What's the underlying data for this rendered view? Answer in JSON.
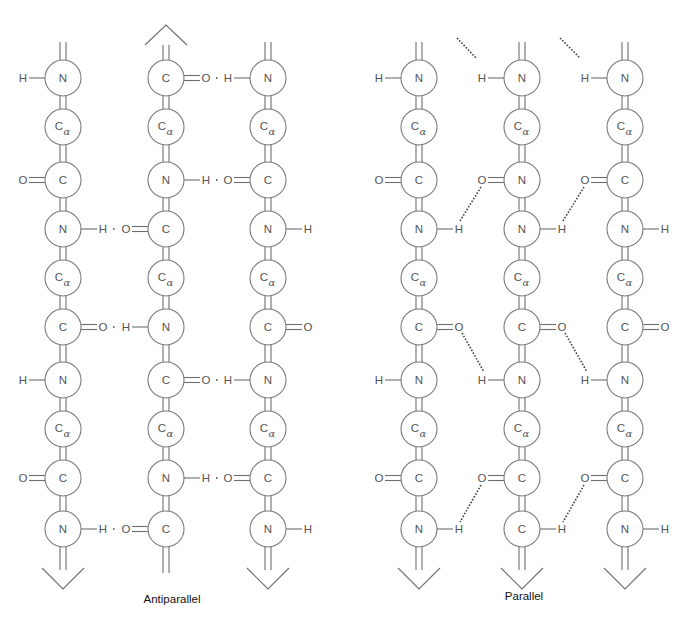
{
  "diagram": {
    "colors": {
      "stroke": "#7a7a7a",
      "text": "#555555",
      "hbond": "#444444",
      "label": "#111111",
      "background": "#ffffff"
    },
    "row_y": [
      78,
      127,
      180,
      229,
      278,
      327,
      380,
      429,
      478,
      529
    ],
    "sheets": [
      {
        "id": "antiparallel",
        "label": "Antiparallel",
        "label_pos": {
          "x": 172,
          "y": 593
        },
        "strands": [
          {
            "x": 63,
            "direction": "down",
            "atoms": [
              "N",
              "Cα",
              "C",
              "N",
              "Cα",
              "C",
              "N",
              "Cα",
              "C",
              "N"
            ],
            "substituents": [
              {
                "row": 0,
                "side": "left",
                "text": "H",
                "bond": "single"
              },
              {
                "row": 2,
                "side": "left",
                "text": "O",
                "bond": "double"
              },
              {
                "row": 3,
                "side": "right",
                "text": "H",
                "bond": "single"
              },
              {
                "row": 5,
                "side": "right",
                "text": "O",
                "bond": "double"
              },
              {
                "row": 6,
                "side": "left",
                "text": "H",
                "bond": "single"
              },
              {
                "row": 8,
                "side": "left",
                "text": "O",
                "bond": "double"
              },
              {
                "row": 9,
                "side": "right",
                "text": "H",
                "bond": "single"
              }
            ]
          },
          {
            "x": 166,
            "direction": "up",
            "atoms": [
              "C",
              "Cα",
              "N",
              "C",
              "Cα",
              "N",
              "C",
              "Cα",
              "N",
              "C"
            ],
            "substituents": [
              {
                "row": 0,
                "side": "right",
                "text": "O",
                "bond": "double"
              },
              {
                "row": 2,
                "side": "right",
                "text": "H",
                "bond": "single"
              },
              {
                "row": 3,
                "side": "left",
                "text": "O",
                "bond": "double"
              },
              {
                "row": 5,
                "side": "left",
                "text": "H",
                "bond": "single"
              },
              {
                "row": 6,
                "side": "right",
                "text": "O",
                "bond": "double"
              },
              {
                "row": 8,
                "side": "right",
                "text": "H",
                "bond": "single"
              },
              {
                "row": 9,
                "side": "left",
                "text": "O",
                "bond": "double"
              }
            ]
          },
          {
            "x": 268,
            "direction": "down",
            "atoms": [
              "N",
              "Cα",
              "C",
              "N",
              "Cα",
              "C",
              "N",
              "Cα",
              "C",
              "N"
            ],
            "substituents": [
              {
                "row": 0,
                "side": "left",
                "text": "H",
                "bond": "single"
              },
              {
                "row": 2,
                "side": "left",
                "text": "O",
                "bond": "double"
              },
              {
                "row": 3,
                "side": "right",
                "text": "H",
                "bond": "single"
              },
              {
                "row": 5,
                "side": "right",
                "text": "O",
                "bond": "double"
              },
              {
                "row": 6,
                "side": "left",
                "text": "H",
                "bond": "single"
              },
              {
                "row": 8,
                "side": "left",
                "text": "O",
                "bond": "double"
              },
              {
                "row": 9,
                "side": "right",
                "text": "H",
                "bond": "single"
              }
            ]
          }
        ],
        "hbonds": [
          {
            "row": 0,
            "from_strand": 1,
            "to_strand": 2,
            "type": "horizontal"
          },
          {
            "row": 2,
            "from_strand": 1,
            "to_strand": 2,
            "type": "horizontal"
          },
          {
            "row": 3,
            "from_strand": 0,
            "to_strand": 1,
            "type": "horizontal"
          },
          {
            "row": 5,
            "from_strand": 0,
            "to_strand": 1,
            "type": "horizontal"
          },
          {
            "row": 6,
            "from_strand": 1,
            "to_strand": 2,
            "type": "horizontal"
          },
          {
            "row": 8,
            "from_strand": 1,
            "to_strand": 2,
            "type": "horizontal"
          },
          {
            "row": 9,
            "from_strand": 0,
            "to_strand": 1,
            "type": "horizontal"
          }
        ]
      },
      {
        "id": "parallel",
        "label": "Parallel",
        "label_pos": {
          "x": 524,
          "y": 590
        },
        "strands": [
          {
            "x": 419,
            "direction": "down",
            "atoms": [
              "N",
              "Cα",
              "C",
              "N",
              "Cα",
              "C",
              "N",
              "Cα",
              "C",
              "N"
            ],
            "substituents": [
              {
                "row": 0,
                "side": "left",
                "text": "H",
                "bond": "single"
              },
              {
                "row": 2,
                "side": "left",
                "text": "O",
                "bond": "double"
              },
              {
                "row": 3,
                "side": "right",
                "text": "H",
                "bond": "single"
              },
              {
                "row": 5,
                "side": "right",
                "text": "O",
                "bond": "double"
              },
              {
                "row": 6,
                "side": "left",
                "text": "H",
                "bond": "single"
              },
              {
                "row": 8,
                "side": "left",
                "text": "O",
                "bond": "double"
              },
              {
                "row": 9,
                "side": "right",
                "text": "H",
                "bond": "single"
              }
            ]
          },
          {
            "x": 522,
            "direction": "down",
            "atoms": [
              "N",
              "Cα",
              "N",
              "N",
              "Cα",
              "C",
              "N",
              "Cα",
              "C",
              "C"
            ],
            "substituents": [
              {
                "row": 0,
                "side": "left",
                "text": "H",
                "bond": "single"
              },
              {
                "row": 2,
                "side": "left",
                "text": "O",
                "bond": "double"
              },
              {
                "row": 3,
                "side": "right",
                "text": "H",
                "bond": "single"
              },
              {
                "row": 5,
                "side": "right",
                "text": "O",
                "bond": "double"
              },
              {
                "row": 6,
                "side": "left",
                "text": "H",
                "bond": "single"
              },
              {
                "row": 8,
                "side": "left",
                "text": "O",
                "bond": "double"
              },
              {
                "row": 9,
                "side": "right",
                "text": "H",
                "bond": "single"
              }
            ]
          },
          {
            "x": 625,
            "direction": "down",
            "atoms": [
              "N",
              "Cα",
              "C",
              "N",
              "Cα",
              "C",
              "N",
              "Cα",
              "C",
              "N"
            ],
            "substituents": [
              {
                "row": 0,
                "side": "left",
                "text": "H",
                "bond": "single"
              },
              {
                "row": 2,
                "side": "left",
                "text": "O",
                "bond": "double"
              },
              {
                "row": 3,
                "side": "right",
                "text": "H",
                "bond": "single"
              },
              {
                "row": 5,
                "side": "right",
                "text": "O",
                "bond": "double"
              },
              {
                "row": 6,
                "side": "left",
                "text": "H",
                "bond": "single"
              },
              {
                "row": 8,
                "side": "left",
                "text": "O",
                "bond": "double"
              },
              {
                "row": 9,
                "side": "right",
                "text": "H",
                "bond": "single"
              }
            ]
          }
        ],
        "hbonds": [
          {
            "from": [
              457,
              38
            ],
            "to": [
              476,
              58
            ],
            "type": "diagonal",
            "partial": true
          },
          {
            "from": [
              560,
              38
            ],
            "to": [
              580,
              58
            ],
            "type": "diagonal",
            "partial": true
          },
          {
            "from": [
              481,
              187
            ],
            "to": [
              460,
              221
            ],
            "type": "diagonal"
          },
          {
            "from": [
              584,
              187
            ],
            "to": [
              563,
              221
            ],
            "type": "diagonal"
          },
          {
            "from": [
              462,
              333
            ],
            "to": [
              484,
              372
            ],
            "type": "diagonal"
          },
          {
            "from": [
              565,
              333
            ],
            "to": [
              587,
              372
            ],
            "type": "diagonal"
          },
          {
            "from": [
              481,
              485
            ],
            "to": [
              460,
              522
            ],
            "type": "diagonal"
          },
          {
            "from": [
              584,
              485
            ],
            "to": [
              563,
              522
            ],
            "type": "diagonal"
          }
        ]
      }
    ]
  }
}
